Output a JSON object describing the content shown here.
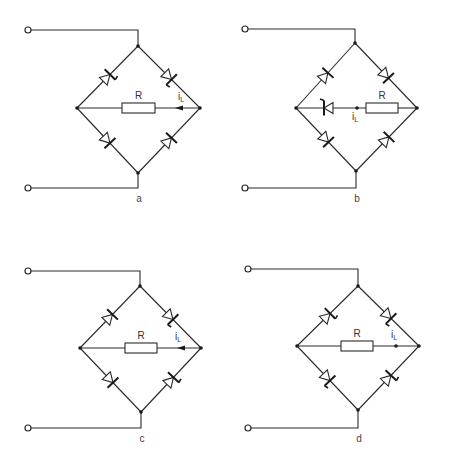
{
  "diagram": {
    "type": "diode bridge circuits with load resistor",
    "panels": [
      {
        "id": "a",
        "label": "a",
        "terminal_top": [
          28,
          30
        ],
        "terminal_bottom": [
          28,
          188
        ],
        "node_top": [
          138,
          46
        ],
        "node_left": [
          77,
          108
        ],
        "node_right": [
          200,
          108
        ],
        "node_bottom": [
          138,
          173
        ],
        "resistor_label": "R",
        "current_label": "i",
        "current_sub": "L",
        "middle_branch": "resistor",
        "resistor_x": [
          122,
          155
        ],
        "arrow": {
          "x": 181,
          "dir": "left"
        },
        "current_label_pos": [
          181,
          100
        ],
        "diodes": [
          {
            "branch": "upper-left",
            "gate": true
          },
          {
            "branch": "upper-right",
            "gate": true
          },
          {
            "branch": "lower-left",
            "gate": false
          },
          {
            "branch": "lower-right",
            "gate": false
          }
        ]
      },
      {
        "id": "b",
        "label": "b",
        "terminal_top": [
          245,
          29
        ],
        "terminal_bottom": [
          245,
          188
        ],
        "node_top": [
          355,
          43
        ],
        "node_left": [
          296,
          108
        ],
        "node_right": [
          417,
          108
        ],
        "node_bottom": [
          356,
          171
        ],
        "resistor_label": "R",
        "current_label": "i",
        "current_sub": "L",
        "middle_branch": "diode+resistor",
        "resistor_x": [
          366,
          398
        ],
        "middle_diode_x": 327,
        "junction_dot": [
          357,
          108
        ],
        "current_label_pos": [
          355,
          120
        ],
        "diodes": [
          {
            "branch": "upper-left",
            "gate": false
          },
          {
            "branch": "upper-right",
            "gate": false
          },
          {
            "branch": "lower-left",
            "gate": false
          },
          {
            "branch": "lower-right",
            "gate": false
          }
        ]
      },
      {
        "id": "c",
        "label": "c",
        "terminal_top": [
          28,
          271
        ],
        "terminal_bottom": [
          28,
          428
        ],
        "node_top": [
          140,
          286
        ],
        "node_left": [
          80,
          348
        ],
        "node_right": [
          201,
          348
        ],
        "node_bottom": [
          141,
          412
        ],
        "resistor_label": "R",
        "current_label": "i",
        "current_sub": "L",
        "middle_branch": "resistor",
        "resistor_x": [
          125,
          157
        ],
        "arrow": {
          "x": 183,
          "dir": "left"
        },
        "current_label_pos": [
          178,
          340
        ],
        "diodes": [
          {
            "branch": "upper-left",
            "gate": false
          },
          {
            "branch": "upper-right",
            "gate": true
          },
          {
            "branch": "lower-left",
            "gate": false
          },
          {
            "branch": "lower-right",
            "gate": true
          }
        ]
      },
      {
        "id": "d",
        "label": "d",
        "terminal_top": [
          248,
          269
        ],
        "terminal_bottom": [
          248,
          428
        ],
        "node_top": [
          358,
          286
        ],
        "node_left": [
          297,
          346
        ],
        "node_right": [
          419,
          346
        ],
        "node_bottom": [
          358,
          410
        ],
        "resistor_label": "R",
        "current_label": "i",
        "current_sub": "L",
        "middle_branch": "resistor",
        "resistor_x": [
          341,
          373
        ],
        "arrow": {
          "x": 396,
          "dir": "dot"
        },
        "current_label_pos": [
          394,
          338
        ],
        "diodes": [
          {
            "branch": "upper-left",
            "gate": true
          },
          {
            "branch": "upper-right",
            "gate": true
          },
          {
            "branch": "lower-left",
            "gate": true
          },
          {
            "branch": "lower-right",
            "gate": true
          }
        ]
      }
    ]
  },
  "labels": {
    "a": "a",
    "b": "b",
    "c": "c",
    "d": "d",
    "R": "R",
    "i": "i",
    "L": "L"
  },
  "colors": {
    "line": "#2a2a2a",
    "background": "#ffffff"
  }
}
